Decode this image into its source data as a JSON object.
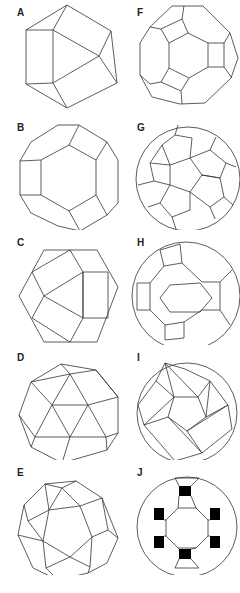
{
  "figure": {
    "panels": [
      {
        "label": "A",
        "shape": "truncated-tetrahedron"
      },
      {
        "label": "B",
        "shape": "truncated-octahedron"
      },
      {
        "label": "C",
        "shape": "cuboctahedron"
      },
      {
        "label": "D",
        "shape": "icosahedron-like"
      },
      {
        "label": "E",
        "shape": "icosidodecahedron"
      },
      {
        "label": "F",
        "shape": "truncated-cuboctahedron"
      },
      {
        "label": "G",
        "shape": "truncated-icosahedron"
      },
      {
        "label": "H",
        "shape": "rhombicosidodecahedron"
      },
      {
        "label": "I",
        "shape": "snub-dodecahedron"
      },
      {
        "label": "J",
        "shape": "truncated-icosidodecahedron"
      }
    ],
    "line_color": "#333333",
    "background": "#ffffff"
  }
}
